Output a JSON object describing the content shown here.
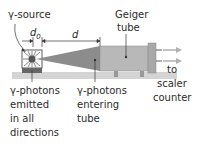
{
  "diagram": {
    "labels": {
      "source": "γ-source",
      "d0": "d",
      "d0_sub": "0",
      "d": "d",
      "geiger_line1": "Geiger",
      "geiger_line2": "tube",
      "to_line1": "to",
      "to_line2": "scaler",
      "to_line3": "counter",
      "emitted_line1": "γ-photons",
      "emitted_line2": "emitted",
      "emitted_line3": "in all",
      "emitted_line4": "directions",
      "entering_line1": "γ-photons",
      "entering_line2": "entering",
      "entering_line3": "tube"
    },
    "colors": {
      "bench": "#d4d4d4",
      "tube_body": "#b8b8b8",
      "tube_end": "#a8a8a8",
      "beam": "#8c8c8c",
      "source_dot": "#555555",
      "source_base": "#666666",
      "arrow": "#b0b0b0"
    }
  }
}
